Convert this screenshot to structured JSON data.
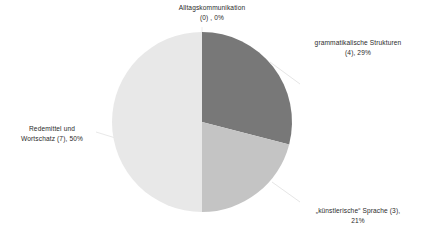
{
  "chart_data": {
    "type": "pie",
    "title": "",
    "categories": [
      "Alltagskommunikation",
      "grammatikalische Strukturen",
      "„künstlerische“ Sprache",
      "Redemittel und Wortschatz"
    ],
    "values": [
      0,
      4,
      3,
      7
    ],
    "percentages": [
      0,
      29,
      21,
      50
    ],
    "total": 14,
    "colors": [
      "#f5f5f5",
      "#787878",
      "#c4c4c4",
      "#e8e8e8"
    ],
    "legend": "none",
    "labels_position": "outside",
    "start_angle_deg": 0,
    "direction": "clockwise",
    "grid": false,
    "xlabel": "",
    "ylabel": ""
  },
  "slices": [
    {
      "key": "alltagskommunikation",
      "name": "Alltagskommunikation",
      "count": 0,
      "percent": 0,
      "color": "#f5f5f5",
      "label_line1": "Alltagskommunikation",
      "label_line2": "(0) , 0%"
    },
    {
      "key": "grammatikalische-strukturen",
      "name": "grammatikalische Strukturen",
      "count": 4,
      "percent": 29,
      "color": "#787878",
      "label_line1": "grammatikalische Strukturen",
      "label_line2": "(4), 29%"
    },
    {
      "key": "kuenstlerische-sprache",
      "name": "„künstlerische“ Sprache",
      "count": 3,
      "percent": 21,
      "color": "#c4c4c4",
      "label_line1": "„künstlerische“ Sprache (3),",
      "label_line2": "21%"
    },
    {
      "key": "redemittel-wortschatz",
      "name": "Redemittel und Wortschatz",
      "count": 7,
      "percent": 50,
      "color": "#e8e8e8",
      "label_line1": "Redemittel und",
      "label_line2": "Wortschatz (7), 50%"
    }
  ],
  "geometry": {
    "center_x": 202,
    "center_y": 122,
    "radius": 90
  },
  "style": {
    "background": "#ffffff",
    "text_color": "#2b2b2b",
    "leader_line_color": "#e3e3e3"
  }
}
